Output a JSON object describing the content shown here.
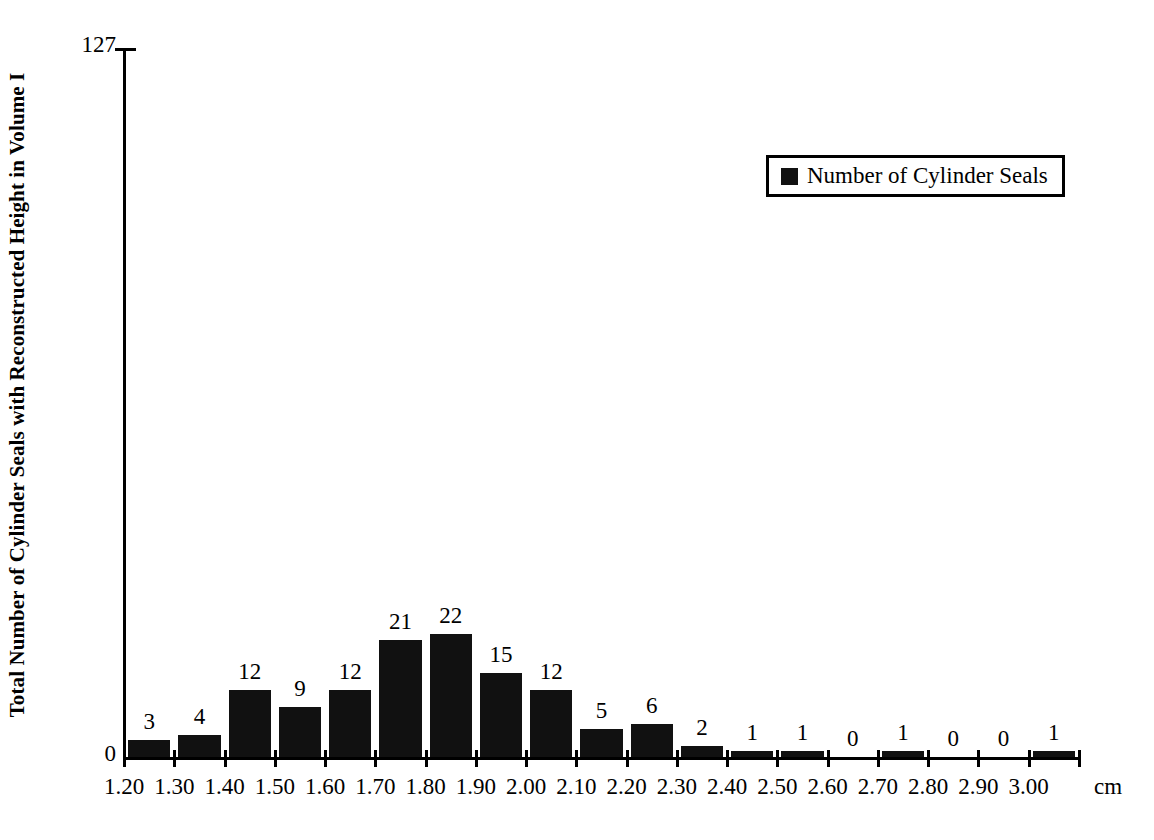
{
  "chart_data": {
    "type": "bar",
    "title": "",
    "subtitle": "",
    "xlabel": "",
    "ylabel": "Total Number of Cylinder Seals with Reconstructed Height in Volume I",
    "x_unit": "cm",
    "categories": [
      "1.20",
      "1.30",
      "1.40",
      "1.50",
      "1.60",
      "1.70",
      "1.80",
      "1.90",
      "2.00",
      "2.10",
      "2.20",
      "2.30",
      "2.40",
      "2.50",
      "2.60",
      "2.70",
      "2.80",
      "2.90",
      "3.00"
    ],
    "values": [
      3,
      4,
      12,
      9,
      12,
      21,
      22,
      15,
      12,
      5,
      6,
      2,
      1,
      1,
      0,
      1,
      0,
      0,
      1
    ],
    "series": [
      {
        "name": "Number of Cylinder Seals",
        "values": [
          3,
          4,
          12,
          9,
          12,
          21,
          22,
          15,
          12,
          5,
          6,
          2,
          1,
          1,
          0,
          1,
          0,
          0,
          1
        ],
        "color": "#111111"
      }
    ],
    "ylim": [
      0,
      127
    ],
    "y_tick_labels": [
      "0",
      "127"
    ],
    "grid": false,
    "legend_position": "top-right",
    "bar_color": "#111111",
    "show_value_labels": true
  },
  "legend": {
    "entries": [
      {
        "label": "Number of Cylinder Seals",
        "swatch_color": "#111111"
      }
    ]
  },
  "axes": {
    "y_max_label": "127",
    "y_min_label": "0",
    "x_unit_label": "cm"
  }
}
